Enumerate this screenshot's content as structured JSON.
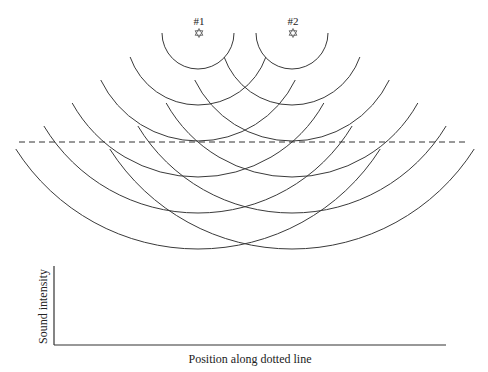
{
  "sources": [
    {
      "label": "#1",
      "x": 198,
      "y": 33,
      "icon": "star-outline-icon"
    },
    {
      "label": "#2",
      "x": 292,
      "y": 33,
      "icon": "star-outline-icon"
    }
  ],
  "wavefronts": {
    "radii": [
      36,
      72,
      108,
      144,
      180,
      216
    ],
    "endpoint_drop": [
      0,
      24,
      47,
      70,
      93,
      116
    ],
    "stroke": "#3a3a3a"
  },
  "dotted_line": {
    "x1": 19,
    "x2": 468,
    "y": 142
  },
  "graph": {
    "y_label": "Sound intensity",
    "x_label": "Position along dotted line",
    "origin": {
      "x": 54,
      "y": 345
    },
    "y_top": 266,
    "x_right": 446
  }
}
